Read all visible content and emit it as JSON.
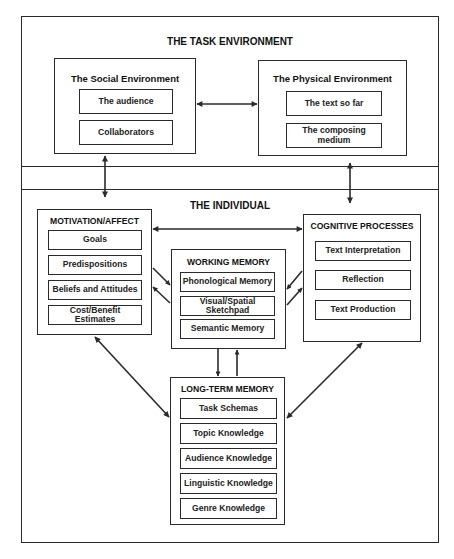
{
  "task_environment": {
    "title": "THE TASK ENVIRONMENT",
    "social": {
      "title": "The Social Environment",
      "items": [
        "The  audience",
        "Collaborators"
      ]
    },
    "physical": {
      "title": "The Physical Environment",
      "items": [
        "The text so far",
        "The composing medium"
      ]
    }
  },
  "individual": {
    "title": "THE INDIVIDUAL",
    "motivation": {
      "title": "MOTIVATION/AFFECT",
      "items": [
        "Goals",
        "Predispositions",
        "Beliefs and Attitudes",
        "Cost/Benefit Estimates"
      ]
    },
    "working_memory": {
      "title": "WORKING MEMORY",
      "items": [
        "Phonological Memory",
        "Visual/Spatial Sketchpad",
        "Semantic Memory"
      ]
    },
    "cognitive": {
      "title": "COGNITIVE PROCESSES",
      "items": [
        "Text Interpretation",
        "Reflection",
        "Text Production"
      ]
    },
    "long_term_memory": {
      "title": "LONG-TERM MEMORY",
      "items": [
        "Task Schemas",
        "Topic Knowledge",
        "Audience Knowledge",
        "Linguistic Knowledge",
        "Genre Knowledge"
      ]
    }
  },
  "colors": {
    "line": "#2a2a2a",
    "background": "#ffffff",
    "text": "#1a1a1a"
  }
}
